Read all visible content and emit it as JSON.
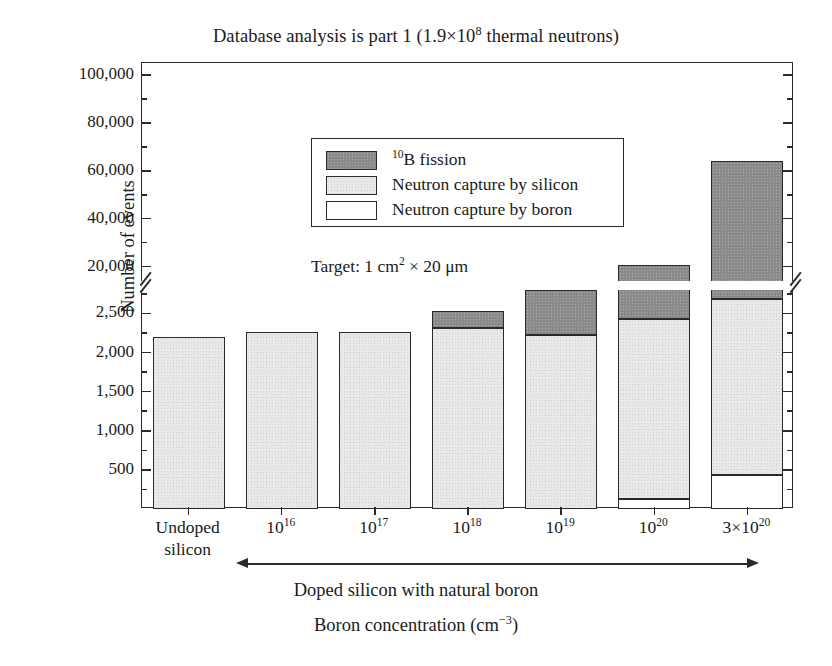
{
  "chart_data": {
    "type": "bar",
    "subtype": "stacked-bar-broken-axis",
    "xlabel": "Boron concentration (cm⁻³)",
    "ylabel": "Number of events",
    "annotation": "Target: 1 cm² × 20 μm",
    "group_caption": "Doped silicon with natural boron",
    "grid": false,
    "legend_position": "upper-left-inside",
    "categories": [
      "Undoped silicon",
      "10¹⁶",
      "10¹⁷",
      "10¹⁸",
      "10¹⁹",
      "10²⁰",
      "3×10²⁰"
    ],
    "category_parts": [
      {
        "base": "Undoped",
        "line2": "silicon",
        "exp": ""
      },
      {
        "base": "10",
        "exp": "16"
      },
      {
        "base": "10",
        "exp": "17"
      },
      {
        "base": "10",
        "exp": "18"
      },
      {
        "base": "10",
        "exp": "19"
      },
      {
        "base": "10",
        "exp": "20"
      },
      {
        "base": "3×10",
        "exp": "20"
      }
    ],
    "series": [
      {
        "name": "Neutron capture by boron",
        "color": "#ffffff",
        "values": [
          0,
          0,
          0,
          0,
          0,
          130,
          430
        ]
      },
      {
        "name": "Neutron capture by silicon",
        "color": "#e9e9e9",
        "values": [
          2200,
          2260,
          2260,
          2310,
          2230,
          2300,
          2250
        ]
      },
      {
        "name": "¹⁰B fission",
        "color": "#8a8a8a",
        "values": [
          0,
          0,
          0,
          220,
          570,
          18100,
          61300
        ]
      }
    ],
    "totals": [
      2200,
      2260,
      2260,
      2530,
      2800,
      20530,
      63980
    ],
    "y_axis": {
      "broken": true,
      "lower_range": [
        0,
        2800
      ],
      "lower_ticks": [
        500,
        1000,
        1500,
        2000,
        2500
      ],
      "lower_tick_labels": [
        "500",
        "1,000",
        "1,500",
        "2,000",
        "2,500"
      ],
      "upper_range": [
        14000,
        105000
      ],
      "upper_ticks": [
        20000,
        40000,
        60000,
        80000,
        100000
      ],
      "upper_tick_labels": [
        "20,000",
        "40,000",
        "60,000",
        "80,000",
        "100,000"
      ],
      "minor_ticks_lower": [
        250,
        750,
        1250,
        1750,
        2250,
        2750
      ],
      "minor_ticks_upper": [
        30000,
        50000,
        70000,
        90000,
        100000
      ]
    },
    "legend": [
      {
        "label": "¹⁰B fission",
        "swatch": "fission",
        "sup": "10",
        "rest": "B fission"
      },
      {
        "label": "Neutron capture by silicon",
        "swatch": "silicon",
        "sup": "",
        "rest": "Neutron capture by silicon"
      },
      {
        "label": "Neutron capture by boron",
        "swatch": "boron",
        "sup": "",
        "rest": "Neutron capture by boron"
      }
    ]
  },
  "title_parts": {
    "pre": "Database analysis is part 1 (1.9×10",
    "sup": "8",
    "post": " thermal neutrons)"
  },
  "annotation_parts": {
    "pre": "Target: 1 cm",
    "sup": "2",
    "post": " × 20 μm"
  },
  "xtitle_parts": {
    "pre": "Boron concentration (cm",
    "sup": "−3",
    "post": ")"
  },
  "colors": {
    "axis": "#2a2a2a",
    "fission": "#8a8a8a",
    "silicon": "#e9e9e9",
    "boron": "#ffffff",
    "background": "#ffffff"
  }
}
